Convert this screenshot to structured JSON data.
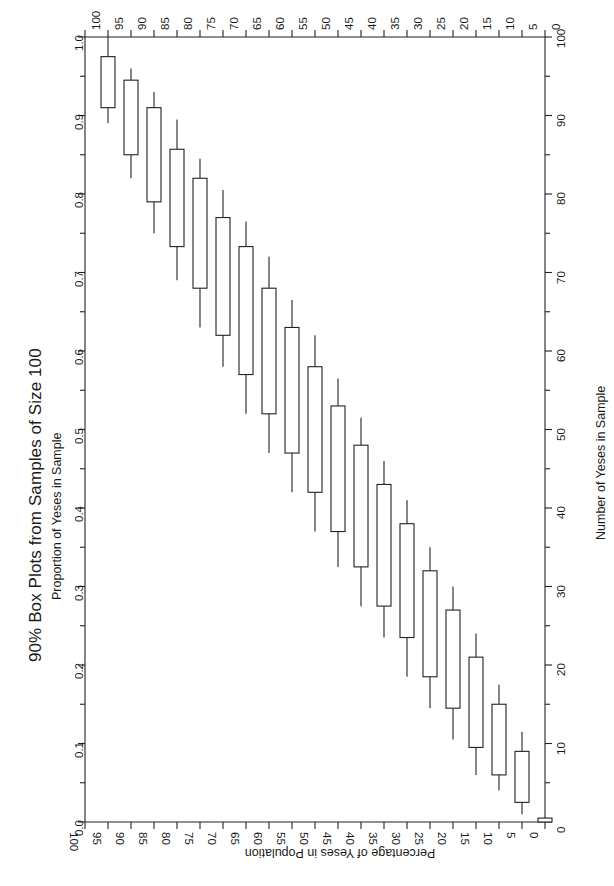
{
  "chart_data": {
    "type": "box",
    "title": "90% Box Plots from Samples of Size 100",
    "subtitle": "Proportion of Yeses in Sample",
    "xlabel": "Percentage of Yeses in Population",
    "ylabel_right": "Number of Yeses in Sample",
    "orientation": "rotated-90",
    "grid": false,
    "legend": "none",
    "x_axis": {
      "label": "Percentage of Yeses in Population",
      "ticks": [
        100,
        95,
        90,
        85,
        80,
        75,
        70,
        65,
        60,
        55,
        50,
        45,
        40,
        35,
        30,
        25,
        20,
        15,
        10,
        5,
        0
      ],
      "tick_labels": [
        "100",
        "95",
        "90",
        "85",
        "80",
        "75",
        "70",
        "65",
        "60",
        "55",
        "50",
        "45",
        "40",
        "35",
        "30",
        "25",
        "20",
        "15",
        "10",
        "5",
        "0"
      ],
      "lim": [
        100,
        0
      ],
      "direction": "descending"
    },
    "y_axis_left": {
      "label": "Proportion of Yeses in Sample",
      "ticks": [
        0.0,
        0.1,
        0.2,
        0.3,
        0.4,
        0.5,
        0.6,
        0.7,
        0.8,
        0.9,
        1.0
      ],
      "tick_labels": [
        "0.0",
        "0.1",
        "0.2",
        "0.3",
        "0.4",
        "0.5",
        "0.6",
        "0.7",
        "0.8",
        "0.9",
        "1.0"
      ],
      "minor_ticks": [
        0.05,
        0.15,
        0.25,
        0.35,
        0.45,
        0.55,
        0.65,
        0.75,
        0.85,
        0.95
      ],
      "lim": [
        0.0,
        1.0
      ]
    },
    "y_axis_right": {
      "label": "Number of Yeses in Sample",
      "ticks": [
        0,
        10,
        20,
        30,
        40,
        50,
        60,
        70,
        80,
        90,
        100
      ],
      "tick_labels": [
        "0",
        "10",
        "20",
        "30",
        "40",
        "50",
        "60",
        "70",
        "80",
        "90",
        "100"
      ],
      "minor_ticks": [
        5,
        15,
        25,
        35,
        45,
        55,
        65,
        75,
        85,
        95
      ],
      "lim": [
        0,
        100
      ]
    },
    "boxes": [
      {
        "category": 95,
        "lower_whisker": 0.89,
        "q1": 0.91,
        "median": 0.91,
        "q3": 0.975,
        "upper_whisker": 1.0
      },
      {
        "category": 90,
        "lower_whisker": 0.82,
        "q1": 0.85,
        "median": 0.85,
        "q3": 0.945,
        "upper_whisker": 0.96
      },
      {
        "category": 85,
        "lower_whisker": 0.75,
        "q1": 0.79,
        "median": 0.79,
        "q3": 0.91,
        "upper_whisker": 0.93
      },
      {
        "category": 80,
        "lower_whisker": 0.69,
        "q1": 0.733,
        "median": 0.733,
        "q3": 0.857,
        "upper_whisker": 0.895
      },
      {
        "category": 75,
        "lower_whisker": 0.63,
        "q1": 0.68,
        "median": 0.68,
        "q3": 0.82,
        "upper_whisker": 0.845
      },
      {
        "category": 70,
        "lower_whisker": 0.58,
        "q1": 0.62,
        "median": 0.62,
        "q3": 0.77,
        "upper_whisker": 0.805
      },
      {
        "category": 65,
        "lower_whisker": 0.52,
        "q1": 0.57,
        "median": 0.57,
        "q3": 0.733,
        "upper_whisker": 0.765
      },
      {
        "category": 60,
        "lower_whisker": 0.47,
        "q1": 0.52,
        "median": 0.52,
        "q3": 0.68,
        "upper_whisker": 0.72
      },
      {
        "category": 55,
        "lower_whisker": 0.42,
        "q1": 0.47,
        "median": 0.47,
        "q3": 0.63,
        "upper_whisker": 0.665
      },
      {
        "category": 50,
        "lower_whisker": 0.37,
        "q1": 0.42,
        "median": 0.42,
        "q3": 0.58,
        "upper_whisker": 0.62
      },
      {
        "category": 45,
        "lower_whisker": 0.325,
        "q1": 0.37,
        "median": 0.37,
        "q3": 0.53,
        "upper_whisker": 0.565
      },
      {
        "category": 40,
        "lower_whisker": 0.275,
        "q1": 0.325,
        "median": 0.325,
        "q3": 0.48,
        "upper_whisker": 0.515
      },
      {
        "category": 35,
        "lower_whisker": 0.235,
        "q1": 0.275,
        "median": 0.275,
        "q3": 0.43,
        "upper_whisker": 0.46
      },
      {
        "category": 30,
        "lower_whisker": 0.185,
        "q1": 0.235,
        "median": 0.235,
        "q3": 0.38,
        "upper_whisker": 0.41
      },
      {
        "category": 25,
        "lower_whisker": 0.145,
        "q1": 0.185,
        "median": 0.185,
        "q3": 0.32,
        "upper_whisker": 0.35
      },
      {
        "category": 20,
        "lower_whisker": 0.105,
        "q1": 0.145,
        "median": 0.145,
        "q3": 0.27,
        "upper_whisker": 0.3
      },
      {
        "category": 15,
        "lower_whisker": 0.06,
        "q1": 0.095,
        "median": 0.095,
        "q3": 0.21,
        "upper_whisker": 0.24
      },
      {
        "category": 10,
        "lower_whisker": 0.04,
        "q1": 0.06,
        "median": 0.06,
        "q3": 0.15,
        "upper_whisker": 0.175
      },
      {
        "category": 5,
        "lower_whisker": 0.01,
        "q1": 0.025,
        "median": 0.025,
        "q3": 0.09,
        "upper_whisker": 0.115
      },
      {
        "category": 0,
        "lower_whisker": 0.0,
        "q1": 0.0,
        "median": 0.0,
        "q3": 0.005,
        "upper_whisker": 0.005
      }
    ]
  },
  "geometry": {
    "plot_left": 85,
    "plot_right": 545,
    "plot_top": 37,
    "plot_bottom": 822
  }
}
